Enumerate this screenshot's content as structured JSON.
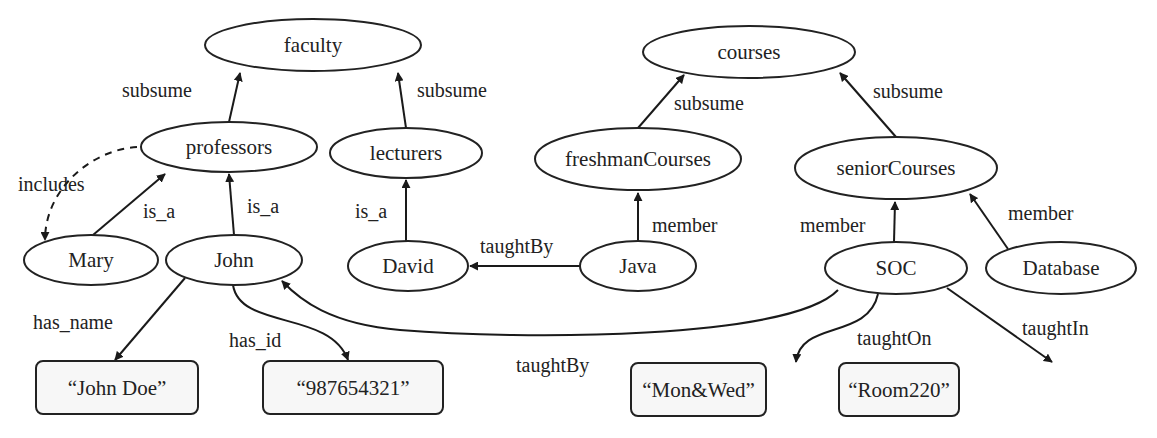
{
  "diagram": {
    "nodes": [
      {
        "id": "faculty",
        "label": "faculty",
        "shape": "ellipse",
        "cx": 313,
        "cy": 45,
        "rx": 108,
        "ry": 26
      },
      {
        "id": "professors",
        "label": "professors",
        "shape": "ellipse",
        "cx": 229,
        "cy": 147,
        "rx": 88,
        "ry": 25
      },
      {
        "id": "lecturers",
        "label": "lecturers",
        "shape": "ellipse",
        "cx": 406,
        "cy": 153,
        "rx": 76,
        "ry": 25
      },
      {
        "id": "Mary",
        "label": "Mary",
        "shape": "ellipse",
        "cx": 91,
        "cy": 260,
        "rx": 67,
        "ry": 25
      },
      {
        "id": "John",
        "label": "John",
        "shape": "ellipse",
        "cx": 234,
        "cy": 260,
        "rx": 68,
        "ry": 25
      },
      {
        "id": "David",
        "label": "David",
        "shape": "ellipse",
        "cx": 408,
        "cy": 266,
        "rx": 60,
        "ry": 25
      },
      {
        "id": "courses",
        "label": "courses",
        "shape": "ellipse",
        "cx": 749,
        "cy": 52,
        "rx": 106,
        "ry": 26
      },
      {
        "id": "freshmanCourses",
        "label": "freshmanCourses",
        "shape": "ellipse",
        "cx": 638,
        "cy": 159,
        "rx": 103,
        "ry": 31
      },
      {
        "id": "Java",
        "label": "Java",
        "shape": "ellipse",
        "cx": 638,
        "cy": 266,
        "rx": 58,
        "ry": 25
      },
      {
        "id": "seniorCourses",
        "label": "seniorCourses",
        "shape": "ellipse",
        "cx": 896,
        "cy": 168,
        "rx": 101,
        "ry": 31
      },
      {
        "id": "SOC",
        "label": "SOC",
        "shape": "ellipse",
        "cx": 896,
        "cy": 268,
        "rx": 71,
        "ry": 26
      },
      {
        "id": "Database",
        "label": "Database",
        "shape": "ellipse",
        "cx": 1061,
        "cy": 268,
        "rx": 75,
        "ry": 26
      },
      {
        "id": "JohnDoe",
        "label": "“John Doe”",
        "shape": "box",
        "x": 36,
        "y": 361,
        "w": 162,
        "h": 53
      },
      {
        "id": "idnum",
        "label": "“987654321”",
        "shape": "box",
        "x": 263,
        "y": 361,
        "w": 180,
        "h": 53
      },
      {
        "id": "MonWed",
        "label": "“Mon&Wed”",
        "shape": "box",
        "x": 631,
        "y": 363,
        "w": 135,
        "h": 53
      },
      {
        "id": "Room220",
        "label": "“Room220”",
        "shape": "box",
        "x": 839,
        "y": 363,
        "w": 120,
        "h": 53
      }
    ],
    "edges": [
      {
        "from": "professors",
        "to": "faculty",
        "label": "subsume",
        "path": "M229,122 L240,73",
        "lx": 122,
        "ly": 97
      },
      {
        "id": "lect",
        "from": "lecturers",
        "to": "faculty",
        "label": "subsume",
        "path": "M406,128 L398,73",
        "lx": 417,
        "ly": 97
      },
      {
        "from": "professors",
        "to": "Mary",
        "label": "includes",
        "path": "M137,147 C90,150 45,190 45,240",
        "lx": 18,
        "ly": 191,
        "dashed": true
      },
      {
        "from": "Mary",
        "to": "professors",
        "label": "is_a",
        "path": "M93,235 L165,174",
        "lx": 143,
        "ly": 218
      },
      {
        "from": "John",
        "to": "professors",
        "label": "is_a",
        "path": "M234,235 L229,174",
        "lx": 247,
        "ly": 213
      },
      {
        "from": "David",
        "to": "lecturers",
        "label": "is_a",
        "path": "M406,241 L406,180",
        "lx": 355,
        "ly": 218
      },
      {
        "from": "Java",
        "to": "David",
        "label": "taughtBy",
        "path": "M580,266 L470,266",
        "lx": 480,
        "ly": 253
      },
      {
        "from": "freshmanCourses",
        "to": "courses",
        "label": "subsume",
        "path": "M638,128 L684,75",
        "lx": 674,
        "ly": 110
      },
      {
        "from": "Java",
        "to": "freshmanCourses",
        "label": "member",
        "path": "M638,241 L638,193",
        "lx": 652,
        "ly": 232
      },
      {
        "from": "seniorCourses",
        "to": "courses",
        "label": "subsume",
        "path": "M896,137 L840,73",
        "lx": 873,
        "ly": 98
      },
      {
        "from": "SOC",
        "to": "seniorCourses",
        "label": "member",
        "path": "M894,242 L895,202",
        "lx": 800,
        "ly": 232
      },
      {
        "from": "Database",
        "to": "seniorCourses",
        "label": "member",
        "path": "M1008,249 L970,194",
        "lx": 1008,
        "ly": 220
      },
      {
        "from": "John",
        "to": "JohnDoe",
        "label": "has_name",
        "path": "M185,278 L115,360",
        "lx": 33,
        "ly": 329
      },
      {
        "from": "John",
        "to": "idnum",
        "label": "has_id",
        "path": "M233,285 C240,330 330,310 348,360",
        "lx": 229,
        "ly": 347
      },
      {
        "from": "SOC",
        "to": "John",
        "label": "taughtBy",
        "path": "M838,290 C790,340 520,340 400,330 C330,324 300,300 282,281",
        "lx": 516,
        "ly": 372
      },
      {
        "from": "SOC",
        "to": "MonWed",
        "label": "taughtOn",
        "path": "M878,294 C868,340 800,320 796,362",
        "lx": 857,
        "ly": 345
      },
      {
        "from": "SOC",
        "to": "Room220",
        "label": "taughtIn",
        "path": "M947,288 L1052,362",
        "lx": 1022,
        "ly": 335
      }
    ]
  }
}
